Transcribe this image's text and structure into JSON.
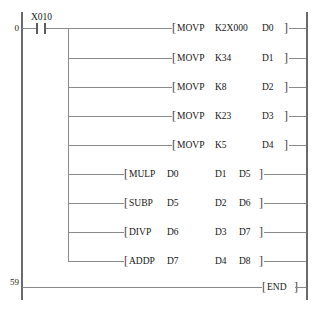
{
  "diagram": {
    "type": "ladder-logic",
    "left_rail_label_column": "step numbers",
    "rungs": [
      {
        "step": "0",
        "contact": {
          "type": "normally-open",
          "label": "X010"
        }
      },
      {
        "step": "59",
        "contact": null
      }
    ]
  },
  "steps": {
    "first": "0",
    "last": "59"
  },
  "contact": {
    "label": "X010",
    "type": "normally-open"
  },
  "brackets": {
    "open": "[",
    "close": "]"
  },
  "instructions": [
    {
      "name": "MOVP",
      "op1": "K2X000",
      "op2": "D0",
      "op3": ""
    },
    {
      "name": "MOVP",
      "op1": "K34",
      "op2": "D1",
      "op3": ""
    },
    {
      "name": "MOVP",
      "op1": "K8",
      "op2": "D2",
      "op3": ""
    },
    {
      "name": "MOVP",
      "op1": "K23",
      "op2": "D3",
      "op3": ""
    },
    {
      "name": "MOVP",
      "op1": "K5",
      "op2": "D4",
      "op3": ""
    },
    {
      "name": "MULP",
      "op1": "D0",
      "op2": "D1",
      "op3": "D5"
    },
    {
      "name": "SUBP",
      "op1": "D5",
      "op2": "D2",
      "op3": "D6"
    },
    {
      "name": "DIVP",
      "op1": "D6",
      "op2": "D3",
      "op3": "D7"
    },
    {
      "name": "ADDP",
      "op1": "D7",
      "op2": "D4",
      "op3": "D8"
    }
  ],
  "end_instruction": {
    "name": "END"
  }
}
